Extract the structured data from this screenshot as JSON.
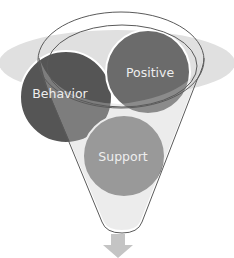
{
  "diagram": {
    "type": "funnel",
    "backdrop": {
      "shape": "ellipse",
      "color": "#e0e0e0"
    },
    "funnel": {
      "stroke": "#5a5a5a",
      "ring_fill": "#f4f4f4"
    },
    "circles": [
      {
        "label": "Behavior",
        "color": "#555555"
      },
      {
        "label": "Positive",
        "color": "#6b6b6b"
      },
      {
        "label": "Support",
        "color": "#808080"
      }
    ],
    "output_arrow": {
      "direction": "down",
      "color": "#c4c4c4"
    }
  }
}
